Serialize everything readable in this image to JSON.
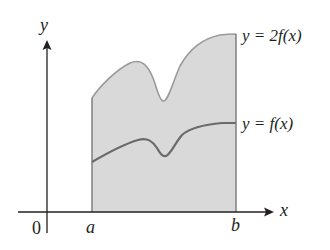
{
  "diagram": {
    "axes": {
      "x_label": "x",
      "y_label": "y",
      "origin_label": "0"
    },
    "interval": {
      "left_label": "a",
      "right_label": "b"
    },
    "curves": [
      {
        "name": "upper",
        "label": "y = 2f(x)",
        "color": "#8c8c8c"
      },
      {
        "name": "lower",
        "label": "y = f(x)",
        "color": "#6e6e6e"
      }
    ],
    "colors": {
      "fill": "#d9d9d9",
      "axis": "#231f20",
      "upper_curve": "#9a9a9a",
      "lower_curve": "#6a6a6a",
      "boundary": "#7a7a7a"
    }
  }
}
